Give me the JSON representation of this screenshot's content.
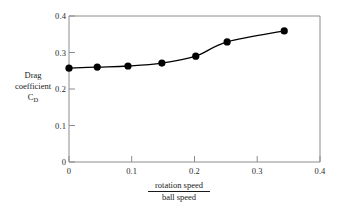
{
  "chart_data": {
    "type": "scatter",
    "title": "",
    "xlabel_numerator": "rotation speed",
    "xlabel_denominator": "ball speed",
    "ylabel_line1": "Drag",
    "ylabel_line2": "coefficient",
    "ylabel_line3_base": "C",
    "ylabel_line3_sub": "D",
    "x": [
      0,
      0.045,
      0.094,
      0.148,
      0.202,
      0.252,
      0.343
    ],
    "values": [
      0.257,
      0.26,
      0.263,
      0.271,
      0.29,
      0.329,
      0.359
    ],
    "xlim": [
      0,
      0.4
    ],
    "ylim": [
      0,
      0.4
    ],
    "xticks": [
      "0",
      "0.1",
      "0.2",
      "0.3",
      "0.4"
    ],
    "xtick_values": [
      0,
      0.1,
      0.2,
      0.3,
      0.4
    ],
    "yticks": [
      "0",
      "0.1",
      "0.2",
      "0.3",
      "0.4"
    ],
    "ytick_values": [
      0,
      0.1,
      0.2,
      0.3,
      0.4
    ],
    "grid": false,
    "legend": false,
    "marker": "filled-circle",
    "line": "smooth-curve",
    "colors": {
      "marker": "#000000",
      "line": "#000000",
      "axis": "#7a7a7a",
      "text": "#1a1a1a",
      "background": "#ffffff"
    }
  }
}
